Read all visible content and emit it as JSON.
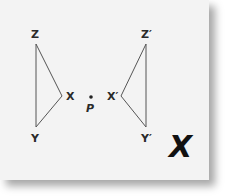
{
  "diagram": {
    "type": "geometry-transformation",
    "center_point": {
      "label": "P",
      "x": 91,
      "y": 97
    },
    "original_triangle": {
      "vertices": [
        {
          "label": "Z",
          "x": 36,
          "y": 44
        },
        {
          "label": "X",
          "x": 62,
          "y": 96
        },
        {
          "label": "Y",
          "x": 36,
          "y": 127
        }
      ]
    },
    "image_triangle": {
      "vertices": [
        {
          "label": "Z′",
          "x": 146,
          "y": 44
        },
        {
          "label": "X′",
          "x": 121,
          "y": 96
        },
        {
          "label": "Y′",
          "x": 146,
          "y": 127
        }
      ]
    },
    "verdict_mark": {
      "label": "X",
      "meaning": "incorrect"
    },
    "colors": {
      "card": "#f3f3f3",
      "lines": "#555555",
      "text": "#2a2a2a",
      "mark": "#111111"
    }
  }
}
